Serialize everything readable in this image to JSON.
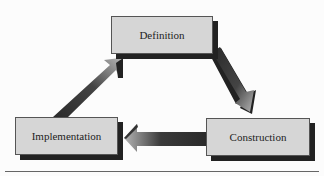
{
  "diagram": {
    "nodes": [
      {
        "id": "definition",
        "label": "Definition"
      },
      {
        "id": "construction",
        "label": "Construction"
      },
      {
        "id": "implementation",
        "label": "Implementation"
      }
    ],
    "edges": [
      {
        "from": "definition",
        "to": "construction"
      },
      {
        "from": "construction",
        "to": "implementation"
      },
      {
        "from": "implementation",
        "to": "definition"
      }
    ],
    "colors": {
      "box_fill": "#d6d6d6",
      "shadow": "#222222",
      "arrow_dark": "#2a2a2a",
      "arrow_light": "#b0b0b0"
    }
  }
}
